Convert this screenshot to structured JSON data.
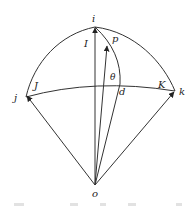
{
  "figure": {
    "type": "diagram",
    "stroke_color": "#333333",
    "background": "#ffffff",
    "labels": {
      "i": "i",
      "I": "I",
      "p": "p",
      "theta": "θ",
      "d": "d",
      "j": "j",
      "J": "J",
      "k": "k",
      "K": "K",
      "o": "o"
    },
    "points": {
      "o": [
        95,
        185
      ],
      "i": [
        95,
        27
      ],
      "j": [
        26,
        97
      ],
      "k": [
        175,
        91
      ],
      "p": [
        107,
        46
      ],
      "d": [
        120,
        84
      ]
    },
    "vectors": [
      {
        "from": "o",
        "to": "i",
        "label": "I"
      },
      {
        "from": "o",
        "to": "p",
        "label": "p"
      },
      {
        "from": "o",
        "to": "j",
        "label": "J"
      },
      {
        "from": "o",
        "to": "k",
        "label": "K"
      }
    ],
    "arcs": [
      {
        "name": "arc-j-i",
        "from": "j",
        "to": "i"
      },
      {
        "name": "arc-i-k",
        "from": "i",
        "to": "k"
      },
      {
        "name": "arc-j-k",
        "from": "j",
        "to": "k",
        "via": "d"
      },
      {
        "name": "arc-i-d",
        "from": "i",
        "to": "d",
        "via": "p"
      }
    ],
    "lines": [
      {
        "name": "line-o-d",
        "from": "o",
        "to": "d"
      }
    ],
    "caption": "(caption cut off — illegible)"
  }
}
